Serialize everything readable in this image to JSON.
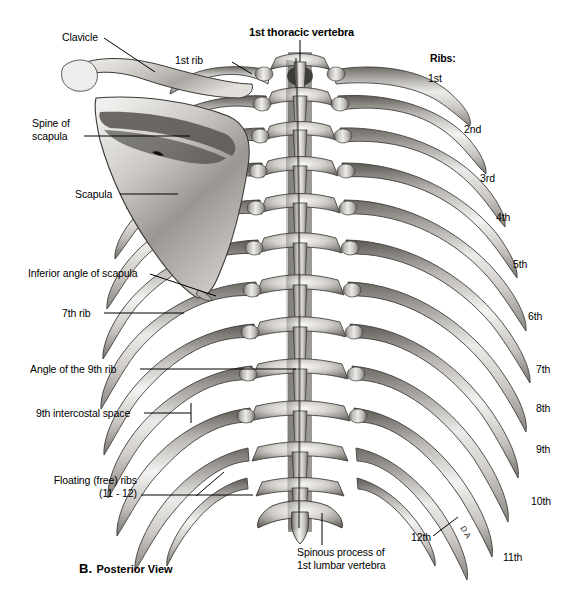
{
  "figure": {
    "caption_letter": "B.",
    "caption_text": "Posterior View",
    "background_color": "#ffffff",
    "ink_color": "#000000",
    "bone_light": "#f2f1ef",
    "bone_mid": "#b9b6b2",
    "bone_dark": "#6f6c69",
    "bone_shadow": "#3a3836"
  },
  "labels": {
    "clavicle": "Clavicle",
    "first_rib": "1st rib",
    "first_thoracic_vertebra": "1st thoracic vertebra",
    "spine_of_scapula": "Spine of\nscapula",
    "scapula": "Scapula",
    "inferior_angle_of_scapula": "Inferior angle of scapula",
    "seventh_rib": "7th rib",
    "angle_of_ninth_rib": "Angle of the 9th rib",
    "ninth_intercostal_space": "9th intercostal space",
    "floating_ribs": "Floating (free) ribs\n(11 - 12)",
    "spinous_process_l1": "Spinous process of\n1st lumbar vertebra",
    "twelfth_rib": "12th",
    "artist_mark": "D A"
  },
  "ribs_legend": {
    "heading": "Ribs:",
    "items": [
      {
        "label": "1st"
      },
      {
        "label": "2nd"
      },
      {
        "label": "3rd"
      },
      {
        "label": "4th"
      },
      {
        "label": "5th"
      },
      {
        "label": "6th"
      },
      {
        "label": "7th"
      },
      {
        "label": "8th"
      },
      {
        "label": "9th"
      },
      {
        "label": "10th"
      },
      {
        "label": "11th"
      }
    ]
  }
}
